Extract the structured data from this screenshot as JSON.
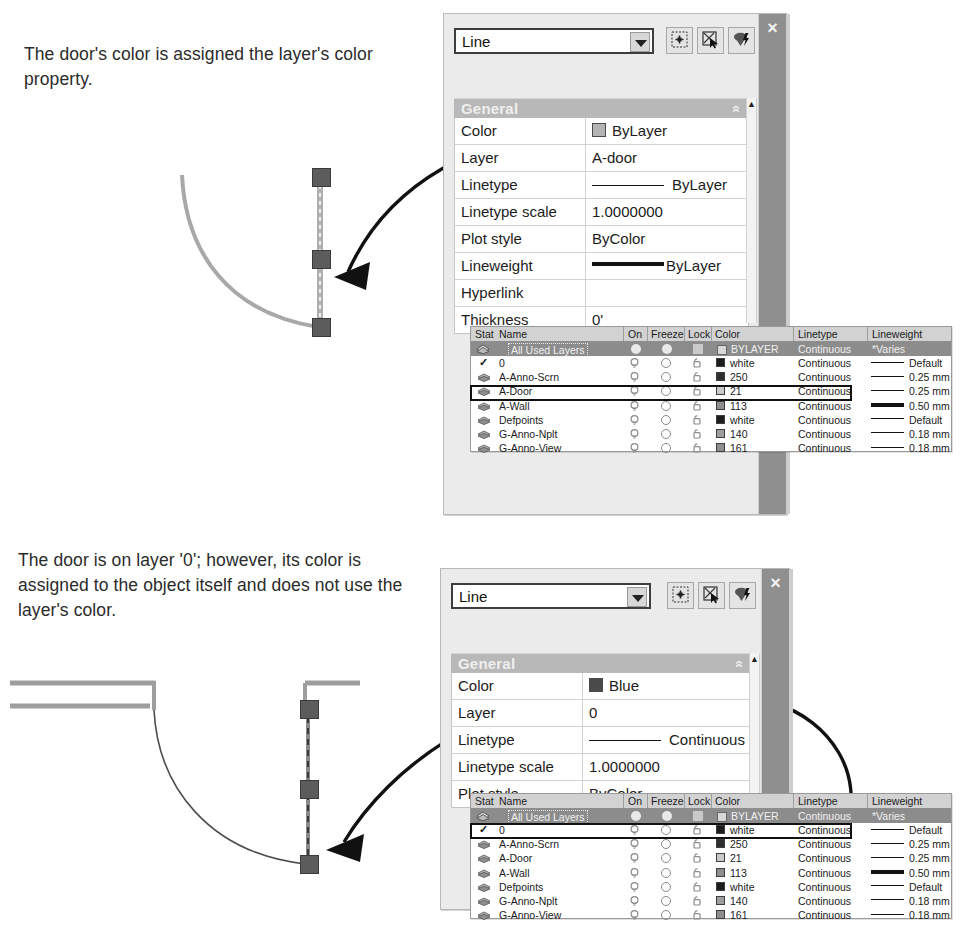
{
  "captions": {
    "top": "The door's color is assigned the layer's color property.",
    "bottom": "The door is on layer '0'; however, its color is assigned to the object itself and does not use the layer's color."
  },
  "palette_top": {
    "object_type": "Line",
    "close_label": "×",
    "section_title": "General",
    "collapse_chevron": "«",
    "toolbar_icons": [
      "quick-select-icon",
      "select-objects-icon",
      "quick-calc-icon"
    ],
    "properties": [
      {
        "key": "Color",
        "value": "ByLayer",
        "swatch": "#b4b4b4",
        "kind": "swatch"
      },
      {
        "key": "Layer",
        "value": "A-door",
        "kind": "text"
      },
      {
        "key": "Linetype",
        "value": "ByLayer",
        "kind": "linetype"
      },
      {
        "key": "Linetype scale",
        "value": "1.0000000",
        "kind": "text"
      },
      {
        "key": "Plot style",
        "value": "ByColor",
        "kind": "text"
      },
      {
        "key": "Lineweight",
        "value": "ByLayer",
        "kind": "lineweight"
      },
      {
        "key": "Hyperlink",
        "value": "",
        "kind": "text"
      },
      {
        "key": "Thickness",
        "value": "0'",
        "kind": "text"
      }
    ]
  },
  "palette_bottom": {
    "object_type": "Line",
    "close_label": "×",
    "section_title": "General",
    "collapse_chevron": "«",
    "toolbar_icons": [
      "quick-select-icon",
      "select-objects-icon",
      "quick-calc-icon"
    ],
    "properties": [
      {
        "key": "Color",
        "value": "Blue",
        "swatch": "#4a4a4a",
        "kind": "swatch"
      },
      {
        "key": "Layer",
        "value": "0",
        "kind": "text"
      },
      {
        "key": "Linetype",
        "value": "Continuous",
        "kind": "linetype"
      },
      {
        "key": "Linetype scale",
        "value": "1.0000000",
        "kind": "text"
      },
      {
        "key": "Plot style",
        "value": "ByColor",
        "kind": "text"
      }
    ]
  },
  "layer_table": {
    "columns": [
      "Stat",
      "Name",
      "On",
      "Freeze",
      "Lock",
      "Color",
      "Linetype",
      "Lineweight"
    ],
    "selected_row": {
      "name": "All Used Layers",
      "color": "BYLAYER",
      "linetype": "Continuous",
      "lineweight": "*Varies"
    },
    "rows": [
      {
        "name": "0",
        "color": "white",
        "swatch": "#1c1c1c",
        "linetype": "Continuous",
        "lineweight": "Default",
        "weight_px": 1,
        "current": true
      },
      {
        "name": "A-Anno-Scrn",
        "color": "250",
        "swatch": "#2e2e2e",
        "linetype": "Continuous",
        "lineweight": "0.25 mm",
        "weight_px": 1,
        "current": false
      },
      {
        "name": "A-Door",
        "color": "21",
        "swatch": "#c9c9c9",
        "linetype": "Continuous",
        "lineweight": "0.25 mm",
        "weight_px": 1,
        "current": false
      },
      {
        "name": "A-Wall",
        "color": "113",
        "swatch": "#8e8e8e",
        "linetype": "Continuous",
        "lineweight": "0.50 mm",
        "weight_px": 4,
        "current": false
      },
      {
        "name": "Defpoints",
        "color": "white",
        "swatch": "#1c1c1c",
        "linetype": "Continuous",
        "lineweight": "Default",
        "weight_px": 1,
        "current": false
      },
      {
        "name": "G-Anno-Nplt",
        "color": "140",
        "swatch": "#9e9e9e",
        "linetype": "Continuous",
        "lineweight": "0.18 mm",
        "weight_px": 1,
        "current": false
      },
      {
        "name": "G-Anno-View",
        "color": "161",
        "swatch": "#8e8e8e",
        "linetype": "Continuous",
        "lineweight": "0.18 mm",
        "weight_px": 1,
        "current": false
      }
    ],
    "highlighted_row_top": "A-Door",
    "highlighted_row_bottom": "0"
  },
  "partial_section_labels": {
    "top": "G",
    "bottom": "Ge"
  },
  "colors": {
    "palette_bg": "#ebebeb",
    "title_bar": "#8f8f8f",
    "section_header": "#b8b8b8",
    "table_header": "#d2d2d2",
    "selected_row": "#8c8c8c",
    "grip": "#5c5c5c"
  }
}
